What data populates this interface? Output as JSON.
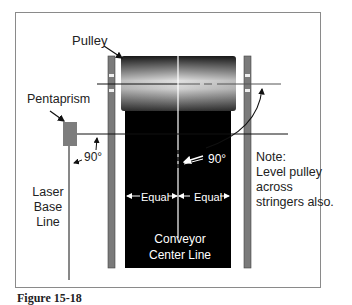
{
  "figure": {
    "labels": {
      "pulley": "Pulley",
      "pentaprism": "Pentaprism",
      "angle_left": "90°",
      "angle_right": "90°",
      "laser_base_line": [
        "Laser",
        "Base",
        "Line"
      ],
      "equal_left": "Equal",
      "equal_right": "Equal",
      "center_line": [
        "Conveyor",
        "Center Line"
      ],
      "note": [
        "Note:",
        "Level pulley",
        "across",
        "stringers also."
      ]
    },
    "caption": "Figure 15-18"
  },
  "colors": {
    "belt": "#000000",
    "stringer": "#7a7a7a",
    "pentaprism": "#7d7d7d",
    "frame": "#8a8a8a"
  }
}
